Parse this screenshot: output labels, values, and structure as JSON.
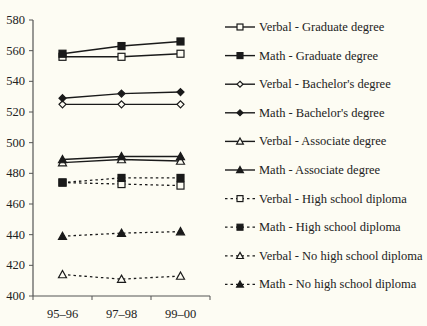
{
  "chart_data": {
    "type": "line",
    "title": "",
    "xlabel": "",
    "ylabel": "",
    "categories": [
      "95–96",
      "97–98",
      "99–00"
    ],
    "ylim": [
      400,
      580
    ],
    "yticks": [
      400,
      420,
      440,
      460,
      480,
      500,
      520,
      540,
      560,
      580
    ],
    "grid": false,
    "legend_position": "right",
    "series": [
      {
        "name": "Verbal - Graduate degree",
        "values": [
          556,
          556,
          558
        ],
        "marker": "square-open",
        "line": "solid"
      },
      {
        "name": "Math - Graduate degree",
        "values": [
          558,
          563,
          566
        ],
        "marker": "square-filled",
        "line": "solid"
      },
      {
        "name": "Verbal - Bachelor's degree",
        "values": [
          525,
          525,
          525
        ],
        "marker": "diamond-open",
        "line": "solid"
      },
      {
        "name": "Math - Bachelor's degree",
        "values": [
          529,
          532,
          533
        ],
        "marker": "diamond-filled",
        "line": "solid"
      },
      {
        "name": "Verbal - Associate degree",
        "values": [
          487,
          489,
          488
        ],
        "marker": "triangle-open",
        "line": "solid"
      },
      {
        "name": "Math - Associate degree",
        "values": [
          489,
          491,
          491
        ],
        "marker": "triangle-filled",
        "line": "solid"
      },
      {
        "name": "Verbal - High school diploma",
        "values": [
          474,
          473,
          472
        ],
        "marker": "square-open",
        "line": "dotted"
      },
      {
        "name": "Math - High school diploma",
        "values": [
          474,
          477,
          477
        ],
        "marker": "square-filled",
        "line": "dotted"
      },
      {
        "name": "Verbal - No high school diploma",
        "values": [
          414,
          411,
          413
        ],
        "marker": "triangle-open",
        "line": "dotted"
      },
      {
        "name": "Math - No high school diploma",
        "values": [
          439,
          441,
          442
        ],
        "marker": "triangle-filled",
        "line": "dotted"
      }
    ]
  },
  "colors": {
    "background": "#fdfcf3",
    "ink": "#1a1a1a",
    "axis": "#555555"
  }
}
